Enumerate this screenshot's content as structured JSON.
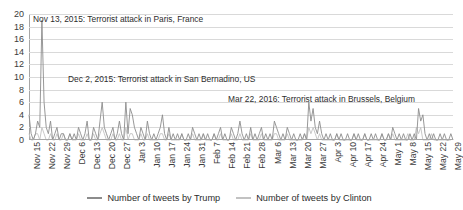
{
  "chart_data": {
    "type": "line",
    "title": "",
    "xlabel": "",
    "ylabel": "",
    "ylim": [
      0,
      20
    ],
    "y_ticks": [
      0,
      2,
      4,
      6,
      8,
      10,
      12,
      14,
      16,
      18,
      20
    ],
    "grid": true,
    "legend_position": "bottom",
    "x_tick_labels": [
      "Nov 15",
      "Nov 22",
      "Nov 29",
      "Dec 6",
      "Dec 13",
      "Dec 20",
      "Dec 27",
      "Jan 3",
      "Jan 10",
      "Jan 17",
      "Jan 24",
      "Jan 31",
      "Feb 7",
      "Feb 14",
      "Feb 21",
      "Feb 28",
      "Mar 6",
      "Mar 13",
      "Mar 20",
      "Mar 27",
      "Apr 3",
      "Apr 10",
      "Apr 17",
      "Apr 24",
      "May 1",
      "May 8",
      "May 15",
      "May 22",
      "May 29"
    ],
    "x_tick_interval_days": 7,
    "x_start": "Nov 15",
    "x_end": "May 29",
    "n_points": 198,
    "series": [
      {
        "name": "Number of tweets by Trump",
        "color": "#8c8c8c",
        "values": [
          4,
          1,
          0,
          1,
          3,
          2,
          19,
          6,
          2,
          1,
          3,
          0,
          1,
          2,
          0,
          1,
          1,
          0,
          0,
          1,
          0,
          1,
          0,
          2,
          1,
          0,
          1,
          3,
          0,
          0,
          2,
          1,
          0,
          3,
          6,
          2,
          1,
          0,
          1,
          2,
          0,
          1,
          3,
          1,
          0,
          6,
          1,
          5,
          4,
          2,
          1,
          0,
          2,
          1,
          0,
          3,
          1,
          0,
          1,
          0,
          1,
          2,
          4,
          1,
          0,
          2,
          0,
          1,
          0,
          1,
          0,
          1,
          0,
          0,
          1,
          0,
          2,
          1,
          0,
          1,
          0,
          1,
          0,
          1,
          0,
          0,
          1,
          0,
          1,
          2,
          0,
          1,
          0,
          0,
          2,
          1,
          0,
          1,
          3,
          1,
          0,
          1,
          0,
          2,
          0,
          1,
          0,
          1,
          2,
          0,
          1,
          0,
          1,
          0,
          3,
          2,
          1,
          0,
          1,
          0,
          2,
          1,
          0,
          1,
          0,
          0,
          1,
          0,
          1,
          0,
          6,
          3,
          5,
          2,
          1,
          3,
          1,
          0,
          1,
          0,
          1,
          0,
          0,
          1,
          0,
          1,
          0,
          0,
          1,
          0,
          0,
          1,
          0,
          1,
          0,
          0,
          1,
          0,
          0,
          1,
          0,
          1,
          0,
          0,
          1,
          0,
          0,
          1,
          0,
          2,
          1,
          0,
          1,
          0,
          1,
          0,
          0,
          1,
          0,
          1,
          0,
          5,
          3,
          4,
          1,
          0,
          1,
          0,
          1,
          0,
          0,
          1,
          0,
          1,
          0,
          0,
          1,
          0
        ]
      },
      {
        "name": "Number of tweets by Clinton",
        "color": "#c2c2c2",
        "values": [
          1,
          0,
          0,
          1,
          1,
          0,
          2,
          1,
          0,
          0,
          1,
          0,
          0,
          1,
          0,
          0,
          1,
          0,
          0,
          1,
          0,
          0,
          0,
          1,
          0,
          0,
          0,
          1,
          0,
          0,
          1,
          0,
          0,
          1,
          2,
          1,
          0,
          0,
          0,
          1,
          0,
          0,
          1,
          0,
          0,
          2,
          0,
          1,
          1,
          0,
          0,
          0,
          1,
          0,
          0,
          1,
          0,
          0,
          0,
          0,
          0,
          1,
          1,
          0,
          0,
          1,
          0,
          0,
          0,
          0,
          0,
          1,
          0,
          0,
          0,
          0,
          1,
          0,
          0,
          0,
          0,
          1,
          0,
          0,
          0,
          0,
          1,
          0,
          0,
          1,
          0,
          0,
          0,
          0,
          1,
          0,
          0,
          0,
          1,
          0,
          0,
          0,
          0,
          1,
          0,
          0,
          0,
          0,
          1,
          0,
          0,
          0,
          0,
          0,
          1,
          1,
          0,
          0,
          0,
          0,
          1,
          0,
          0,
          0,
          0,
          0,
          0,
          0,
          1,
          0,
          2,
          1,
          2,
          1,
          0,
          1,
          0,
          0,
          0,
          0,
          0,
          0,
          0,
          1,
          0,
          0,
          0,
          0,
          0,
          0,
          0,
          1,
          0,
          0,
          0,
          0,
          1,
          0,
          0,
          0,
          0,
          0,
          0,
          0,
          1,
          0,
          0,
          1,
          0,
          1,
          0,
          0,
          0,
          0,
          0,
          0,
          1,
          0,
          0,
          0,
          2,
          1,
          2,
          0,
          0,
          0,
          0,
          1,
          0,
          0,
          0,
          0,
          0,
          0,
          0,
          0,
          0
        ]
      }
    ],
    "annotations": [
      {
        "text": "Nov 13, 2015: Terrorist attack in Paris, France"
      },
      {
        "text": "Dec 2, 2015: Terrorist attack in San Bernadino, US"
      },
      {
        "text": "Mar 22, 2016: Terrorist attack in Brussels, Belgium"
      }
    ]
  }
}
